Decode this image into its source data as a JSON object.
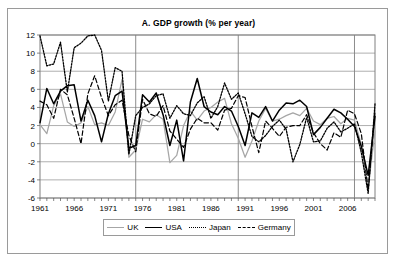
{
  "figure": {
    "title": "A. GDP growth (% per year)",
    "background": "#ffffff",
    "border_color": "#9a9a9a"
  },
  "axes": {
    "y_ticks": [
      "12",
      "10",
      "8",
      "6",
      "4",
      "2",
      "0",
      "-2",
      "-4",
      "-6"
    ],
    "x_ticks": [
      "1961",
      "1966",
      "1971",
      "1976",
      "1981",
      "1986",
      "1991",
      "1996",
      "2001",
      "2006"
    ]
  },
  "legend": {
    "position": "bottom",
    "entries": [
      {
        "label": "UK",
        "color": "#a6a6a6",
        "style": "solid",
        "icon": "line-swatch-icon"
      },
      {
        "label": "USA",
        "color": "#000000",
        "style": "solid",
        "icon": "line-swatch-icon"
      },
      {
        "label": "Japan",
        "color": "#000000",
        "style": "dotted",
        "icon": "line-swatch-icon"
      },
      {
        "label": "Germany",
        "color": "#000000",
        "style": "dashed",
        "icon": "line-swatch-icon"
      }
    ]
  },
  "chart_data": {
    "type": "line",
    "title": "A. GDP growth (% per year)",
    "xlabel": "",
    "ylabel": "",
    "xlim": [
      1961,
      2010
    ],
    "ylim": [
      -6,
      12
    ],
    "y_tick_values": [
      12,
      10,
      8,
      6,
      4,
      2,
      0,
      -2,
      -4,
      -6
    ],
    "x_tick_values": [
      1961,
      1966,
      1971,
      1976,
      1981,
      1986,
      1991,
      1996,
      2001,
      2006
    ],
    "grid": "horizontal gridlines every 2 units; vertical gridlines at 1975, 1990, 2007",
    "vertical_gridlines": [
      1975,
      1990,
      2007
    ],
    "legend_position": "bottom",
    "x": [
      1961,
      1962,
      1963,
      1964,
      1965,
      1966,
      1967,
      1968,
      1969,
      1970,
      1971,
      1972,
      1973,
      1974,
      1975,
      1976,
      1977,
      1978,
      1979,
      1980,
      1981,
      1982,
      1983,
      1984,
      1985,
      1986,
      1987,
      1988,
      1989,
      1990,
      1991,
      1992,
      1993,
      1994,
      1995,
      1996,
      1997,
      1998,
      1999,
      2000,
      2001,
      2002,
      2003,
      2004,
      2005,
      2006,
      2007,
      2008,
      2009,
      2010
    ],
    "series": [
      {
        "name": "UK",
        "color": "#a6a6a6",
        "style": "solid",
        "values": [
          2.1,
          1.1,
          4.2,
          5.5,
          2.4,
          1.9,
          2.3,
          4.1,
          2.1,
          2.3,
          2.0,
          3.5,
          7.1,
          -1.5,
          -0.7,
          2.7,
          2.4,
          3.2,
          2.7,
          -2.1,
          -1.3,
          2.0,
          3.6,
          2.6,
          3.6,
          4.0,
          4.6,
          5.0,
          2.2,
          0.6,
          -1.5,
          0.3,
          2.5,
          3.9,
          2.5,
          2.7,
          3.1,
          3.4,
          3.1,
          3.9,
          2.5,
          2.1,
          2.8,
          3.0,
          2.2,
          2.8,
          2.6,
          -0.1,
          -4.9,
          1.4
        ]
      },
      {
        "name": "USA",
        "color": "#000000",
        "style": "solid",
        "values": [
          2.3,
          6.1,
          4.4,
          5.8,
          6.4,
          6.5,
          2.5,
          4.8,
          3.1,
          0.2,
          3.3,
          5.3,
          5.8,
          -0.5,
          -0.2,
          5.4,
          4.6,
          5.6,
          3.2,
          -0.2,
          2.6,
          -1.9,
          4.6,
          7.2,
          4.1,
          3.5,
          3.2,
          4.1,
          3.6,
          1.9,
          -0.2,
          3.4,
          2.9,
          4.1,
          2.5,
          3.7,
          4.5,
          4.4,
          4.8,
          4.1,
          1.0,
          1.8,
          2.8,
          3.8,
          3.4,
          2.7,
          1.9,
          -0.3,
          -3.5,
          3.0
        ]
      },
      {
        "name": "Japan",
        "color": "#000000",
        "style": "dotted",
        "values": [
          11.9,
          8.6,
          8.8,
          11.2,
          5.7,
          10.6,
          11.1,
          11.9,
          12.0,
          10.3,
          4.7,
          8.4,
          8.0,
          -1.2,
          3.1,
          4.0,
          4.4,
          5.3,
          5.5,
          2.8,
          4.2,
          3.3,
          3.1,
          4.5,
          5.2,
          2.8,
          4.1,
          6.7,
          4.9,
          5.6,
          3.3,
          0.8,
          0.2,
          0.9,
          1.9,
          2.6,
          1.6,
          -2.0,
          -0.1,
          2.9,
          0.2,
          0.3,
          1.7,
          2.4,
          1.3,
          1.7,
          2.2,
          -1.0,
          -5.5,
          4.4
        ]
      },
      {
        "name": "Germany",
        "color": "#000000",
        "style": "dashed",
        "values": [
          4.7,
          4.3,
          2.8,
          6.0,
          5.4,
          2.8,
          0.0,
          5.5,
          7.5,
          5.1,
          3.1,
          4.3,
          4.8,
          0.9,
          -0.9,
          4.9,
          3.3,
          3.0,
          4.2,
          1.4,
          0.5,
          -0.4,
          1.6,
          2.8,
          2.3,
          2.3,
          1.5,
          3.7,
          3.9,
          5.3,
          5.1,
          1.9,
          -1.0,
          2.5,
          1.7,
          0.8,
          1.8,
          2.0,
          2.0,
          3.2,
          1.2,
          0.0,
          -0.7,
          1.2,
          0.7,
          3.7,
          3.3,
          1.1,
          -5.1,
          3.6
        ]
      }
    ]
  }
}
